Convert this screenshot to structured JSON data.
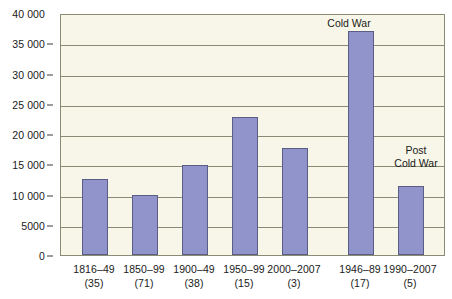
{
  "figure": {
    "clipped_top_text": "",
    "background_color": "#ffffff",
    "plot_background_color": "#f8f6e8",
    "grid_color": "#8b8a75",
    "bar_fill_color": "#9094ca",
    "bar_border_color": "#5a5d86"
  },
  "chart_data": {
    "type": "bar",
    "title": "",
    "xlabel": "",
    "ylabel": "",
    "ylim": [
      0,
      40000
    ],
    "ytick_labels": [
      "40 000",
      "35 000",
      "30 000",
      "25 000",
      "20 000",
      "15 000",
      "10 000",
      "5000",
      "0"
    ],
    "ytick_values": [
      40000,
      35000,
      30000,
      25000,
      20000,
      15000,
      10000,
      5000,
      0
    ],
    "grid": true,
    "legend": "none",
    "categories": [
      "1816–49",
      "1850–99",
      "1900–49",
      "1950–99",
      "2000–2007",
      "1946–89",
      "1990–2007"
    ],
    "category_counts": [
      "(35)",
      "(71)",
      "(38)",
      "(15)",
      "(3)",
      "(17)",
      "(5)"
    ],
    "values": [
      12500,
      10000,
      14900,
      22800,
      17700,
      37000,
      11400
    ],
    "annotations": [
      {
        "text": "Cold War",
        "target_category": "1946–89"
      },
      {
        "text": "Post\nCold War",
        "target_category": "1990–2007"
      }
    ],
    "annotation_cold_war_line1": "Cold War",
    "annotation_post_line1": "Post",
    "annotation_post_line2": "Cold War",
    "groups": [
      {
        "name": "",
        "categories": [
          "1816–49",
          "1850–99",
          "1900–49",
          "1950–99",
          "2000–2007"
        ]
      },
      {
        "name": "",
        "categories": [
          "1946–89",
          "1990–2007"
        ]
      }
    ]
  }
}
